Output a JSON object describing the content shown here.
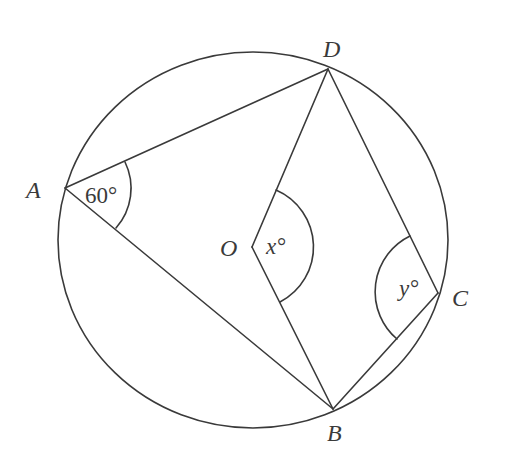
{
  "figure": {
    "type": "circle-geometry",
    "stroke_color": "#3a3a3a",
    "background": "#ffffff",
    "circle": {
      "center_label": "O",
      "cx": 253,
      "cy": 240,
      "rx": 195,
      "ry": 188
    },
    "points": {
      "A": {
        "label": "A",
        "x": 65,
        "y": 188
      },
      "B": {
        "label": "B",
        "x": 333,
        "y": 409
      },
      "C": {
        "label": "C",
        "x": 438,
        "y": 293
      },
      "D": {
        "label": "D",
        "x": 328,
        "y": 69
      },
      "O": {
        "label": "O",
        "x": 252,
        "y": 247
      }
    },
    "segments": [
      "AD",
      "AB",
      "OD",
      "OB",
      "DC",
      "BC"
    ],
    "angles": {
      "angle_A": {
        "vertex": "A",
        "text": "60°",
        "value": 60
      },
      "angle_O": {
        "vertex": "O",
        "text": "x°",
        "variable": "x"
      },
      "angle_C": {
        "vertex": "C",
        "text": "y°",
        "variable": "y"
      }
    }
  }
}
